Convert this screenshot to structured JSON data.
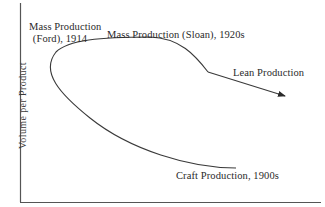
{
  "diagram": {
    "type": "conceptual-curve",
    "y_axis_label": "Volume per Product",
    "x_axis_label": "",
    "colors": {
      "line": "#3a3a3a",
      "axis": "#555555",
      "text": "#2a2a2a",
      "background": "#ffffff"
    },
    "stages": [
      {
        "id": "craft",
        "label": "Craft Production, 1900s"
      },
      {
        "id": "ford",
        "label_line1": "Mass Production",
        "label_line2": "(Ford), 1914"
      },
      {
        "id": "sloan",
        "label": "Mass Production (Sloan), 1920s"
      },
      {
        "id": "lean",
        "label": "Lean Production"
      }
    ],
    "path_order": [
      "Craft Production, 1900s",
      "Mass Production (Ford), 1914",
      "Mass Production (Sloan), 1920s",
      "Lean Production"
    ],
    "arrow_end": "Lean Production"
  }
}
